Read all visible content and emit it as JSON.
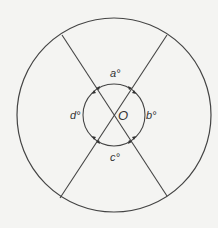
{
  "diagram": {
    "center_label": "O",
    "angles": [
      {
        "id": "a",
        "label": "a°",
        "position": "top"
      },
      {
        "id": "b",
        "label": "b°",
        "position": "right"
      },
      {
        "id": "c",
        "label": "c°",
        "position": "bottom"
      },
      {
        "id": "d",
        "label": "d°",
        "position": "left"
      }
    ],
    "colors": {
      "stroke": "#444444",
      "background": "#f4f4f2"
    }
  }
}
